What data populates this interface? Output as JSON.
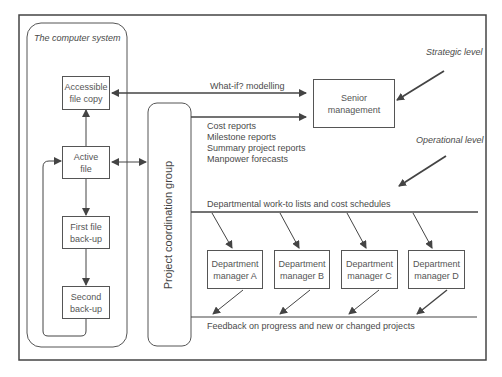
{
  "diagram": {
    "frame_label": "The computer system",
    "level_labels": {
      "strategic": "Strategic level",
      "operational": "Operational level"
    },
    "file_boxes": [
      {
        "id": "accessible",
        "line1": "Accessible",
        "line2": "file copy"
      },
      {
        "id": "active",
        "line1": "Active",
        "line2": "file"
      },
      {
        "id": "first",
        "line1": "First file",
        "line2": "back-up"
      },
      {
        "id": "second",
        "line1": "Second",
        "line2": "back-up"
      }
    ],
    "project_group": "Project coordination group",
    "senior_management": {
      "line1": "Senior",
      "line2": "management"
    },
    "flows": {
      "what_if": "What-if? modelling",
      "reports": [
        "Cost reports",
        "Milestone reports",
        "Summary project reports",
        "Manpower forecasts"
      ],
      "work_to": "Departmental work-to lists and cost schedules",
      "feedback": "Feedback on progress and new or changed projects"
    },
    "departments": [
      {
        "line1": "Department",
        "line2": "manager A"
      },
      {
        "line1": "Department",
        "line2": "manager B"
      },
      {
        "line1": "Department",
        "line2": "manager C"
      },
      {
        "line1": "Department",
        "line2": "manager D"
      }
    ],
    "colors": {
      "line": "#444444",
      "text": "#4a4a4a",
      "background": "#ffffff"
    }
  }
}
